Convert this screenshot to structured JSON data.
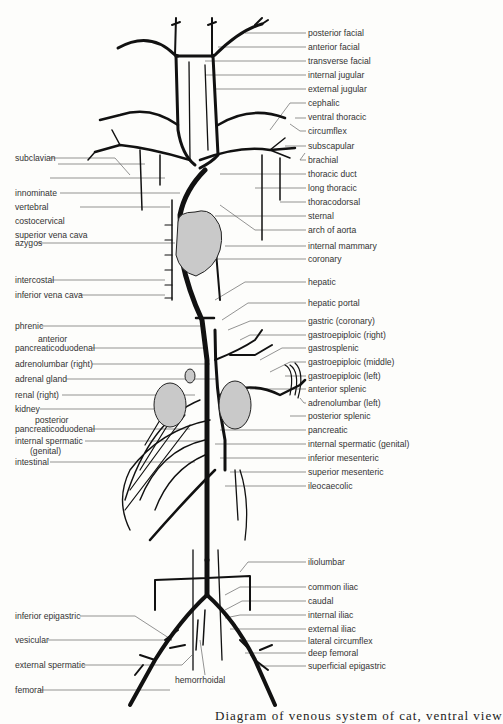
{
  "figure": {
    "caption": "Fig. 13.11. Diagram of venous system of a mammal (cat)",
    "caption_visible": "Diagram of venous system of cat, ventral view"
  },
  "labels_right": [
    {
      "text": "posterior facial",
      "y": 33
    },
    {
      "text": "anterior facial",
      "y": 47
    },
    {
      "text": "transverse facial",
      "y": 61
    },
    {
      "text": "internal jugular",
      "y": 75
    },
    {
      "text": "external jugular",
      "y": 89
    },
    {
      "text": "cephalic",
      "y": 103
    },
    {
      "text": "ventral thoracic",
      "y": 117
    },
    {
      "text": "circumflex",
      "y": 131
    },
    {
      "text": "subscapular",
      "y": 146
    },
    {
      "text": "brachial",
      "y": 160
    },
    {
      "text": "thoracic duct",
      "y": 174
    },
    {
      "text": "long thoracic",
      "y": 188
    },
    {
      "text": "thoracodorsal",
      "y": 202
    },
    {
      "text": "sternal",
      "y": 216
    },
    {
      "text": "arch of aorta",
      "y": 230
    },
    {
      "text": "internal mammary",
      "y": 246
    },
    {
      "text": "coronary",
      "y": 259
    },
    {
      "text": "hepatic",
      "y": 282
    },
    {
      "text": "hepatic portal",
      "y": 303
    },
    {
      "text": "gastric (coronary)",
      "y": 321
    },
    {
      "text": "gastroepiploic (right)",
      "y": 335
    },
    {
      "text": "gastrosplenic",
      "y": 348
    },
    {
      "text": "gastroepiploic (middle)",
      "y": 362
    },
    {
      "text": "gastroepiploic (left)",
      "y": 376
    },
    {
      "text": "anterior splenic",
      "y": 389
    },
    {
      "text": "adrenolumbar (left)",
      "y": 403
    },
    {
      "text": "posterior splenic",
      "y": 416
    },
    {
      "text": "pancreatic",
      "y": 430
    },
    {
      "text": "internal spermatic (genital)",
      "y": 444
    },
    {
      "text": "inferior mesenteric",
      "y": 458
    },
    {
      "text": "superior mesenteric",
      "y": 472
    },
    {
      "text": "ileocaecolic",
      "y": 486
    },
    {
      "text": "iliolumbar",
      "y": 562
    },
    {
      "text": "common iliac",
      "y": 587
    },
    {
      "text": "caudal",
      "y": 601
    },
    {
      "text": "internal iliac",
      "y": 615
    },
    {
      "text": "external iliac",
      "y": 629
    },
    {
      "text": "lateral circumflex",
      "y": 641
    },
    {
      "text": "deep femoral",
      "y": 653
    },
    {
      "text": "superficial epigastric",
      "y": 666
    }
  ],
  "labels_left": [
    {
      "text": "subclavian",
      "x": 15,
      "y": 158
    },
    {
      "text": "innominate",
      "x": 15,
      "y": 164
    },
    {
      "text": "vertebral",
      "x": 15,
      "y": 178
    },
    {
      "text": "costocervical",
      "x": 15,
      "y": 193
    },
    {
      "text": "superior vena cava",
      "x": 15,
      "y": 207
    },
    {
      "text": "azygos",
      "x": 15,
      "y": 243
    },
    {
      "text": "intercostal",
      "x": 15,
      "y": 280
    },
    {
      "text": "inferior vena cava",
      "x": 15,
      "y": 295
    },
    {
      "text": "phrenic",
      "x": 15,
      "y": 326
    },
    {
      "text": "anterior",
      "x": 38,
      "y": 339
    },
    {
      "text": "pancreaticoduodenal",
      "x": 15,
      "y": 348
    },
    {
      "text": "adrenolumbar (right)",
      "x": 15,
      "y": 364
    },
    {
      "text": "adrenal gland",
      "x": 15,
      "y": 379
    },
    {
      "text": "renal (right)",
      "x": 15,
      "y": 395
    },
    {
      "text": "kidney",
      "x": 15,
      "y": 409
    },
    {
      "text": "posterior",
      "x": 35,
      "y": 420
    },
    {
      "text": "pancreaticoduodenal",
      "x": 15,
      "y": 429
    },
    {
      "text": "internal spermatic",
      "x": 15,
      "y": 441
    },
    {
      "text": "(genital)",
      "x": 30,
      "y": 451
    },
    {
      "text": "intestinal",
      "x": 15,
      "y": 462
    },
    {
      "text": "inferior epigastric",
      "x": 15,
      "y": 616
    },
    {
      "text": "vesicular",
      "x": 15,
      "y": 640
    },
    {
      "text": "external spermatic",
      "x": 15,
      "y": 665
    },
    {
      "text": "femoral",
      "x": 15,
      "y": 690
    }
  ],
  "labels_center": [
    {
      "text": "hemorrhoidal",
      "x": 175,
      "y": 680
    }
  ],
  "colors": {
    "vessel": "#111111",
    "leader_line": "#666666",
    "organ_fill": "#c9c9c9",
    "background": "#fdfdfb"
  }
}
